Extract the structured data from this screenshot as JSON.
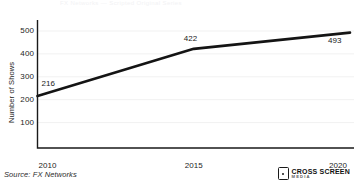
{
  "title_ghost": "FX Networks — Scripted Original Series",
  "chart_data": {
    "type": "line",
    "title": "",
    "xlabel": "",
    "ylabel": "Number of Shows",
    "x": [
      2010,
      2015,
      2020
    ],
    "categories": [
      "2010",
      "2015",
      "2020"
    ],
    "values": [
      216,
      422,
      493
    ],
    "point_labels": [
      "216",
      "422",
      "493"
    ],
    "series": [
      {
        "name": "Number of Shows",
        "values": [
          216,
          422,
          493
        ],
        "color": "#141414"
      }
    ],
    "xlim": [
      2010,
      2020
    ],
    "ylim": [
      0,
      520
    ],
    "y_ticks": [
      100,
      200,
      300,
      400,
      500
    ],
    "y_tick_labels": [
      "100",
      "200",
      "300",
      "400",
      "500"
    ],
    "x_ticks": [
      2010,
      2015,
      2020
    ],
    "x_tick_labels": [
      "2010",
      "2015",
      "2020"
    ],
    "grid": true,
    "grid_color": "#f1f1f1",
    "axis_color": "#1a1a1a",
    "legend": false,
    "line_width": 2.6
  },
  "footer": {
    "source": "Source: FX Networks",
    "logo_main": "CROSS SCREEN",
    "logo_sub": "MEDIA"
  }
}
